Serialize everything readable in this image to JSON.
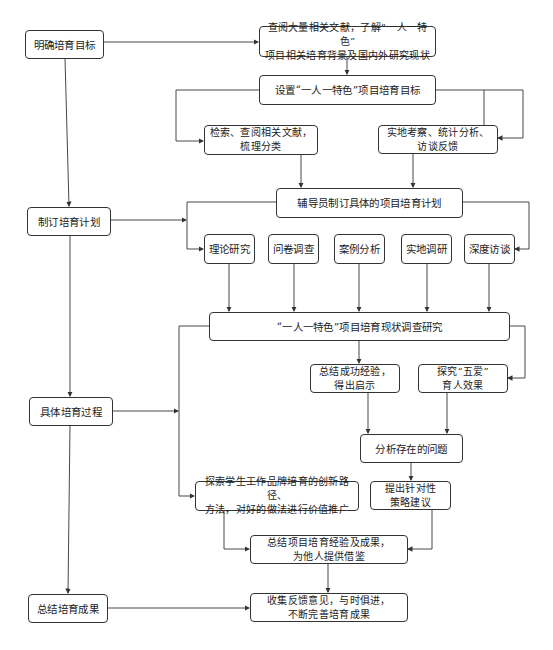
{
  "diagram": {
    "type": "flowchart",
    "stages": [
      {
        "id": "s1",
        "label": "明确培育目标"
      },
      {
        "id": "s2",
        "label": "制订培育计划"
      },
      {
        "id": "s3",
        "label": "具体培育过程"
      },
      {
        "id": "s4",
        "label": "总结培育成果"
      }
    ],
    "nodes": {
      "n_review": "查阅大量相关文献，了解“一人一特色”\n项目相关培育背景及国内外研究现状",
      "n_set_goal": "设置“一人一特色”项目培育目标",
      "n_search": "检索、查阅相关文献，\n梳理分类",
      "n_field": "实地考察、统计分析、\n访谈反馈",
      "n_plan": "辅导员制订具体的项目培育计划",
      "n_m1": "理论研究",
      "n_m2": "问卷调查",
      "n_m3": "案例分析",
      "n_m4": "实地调研",
      "n_m5": "深度访谈",
      "n_survey": "“一人一特色”项目培育现状调查研究",
      "n_experience": "总结成功经验，\n得出启示",
      "n_wuai": "探究“五爱”\n育人效果",
      "n_problem": "分析存在的问题",
      "n_explore": "探索学生工作品牌培育的创新路径、\n方法，对好的做法进行价值推广",
      "n_suggest": "提出针对性\n策略建议",
      "n_summary": "总结项目培育经验及成果，\n为他人提供借鉴",
      "n_feedback": "收集反馈意见，与时俱进，\n不断完善培育成果"
    },
    "edges": [
      [
        "s1",
        "s2"
      ],
      [
        "s2",
        "s3"
      ],
      [
        "s3",
        "s4"
      ],
      [
        "s1",
        "n_review"
      ],
      [
        "n_review",
        "n_set_goal"
      ],
      [
        "n_set_goal",
        "n_search"
      ],
      [
        "n_set_goal",
        "n_field"
      ],
      [
        "n_search",
        "n_plan"
      ],
      [
        "n_field",
        "n_plan"
      ],
      [
        "s2",
        "n_plan-branch"
      ],
      [
        "n_plan",
        "n_m1"
      ],
      [
        "n_plan",
        "n_m5"
      ],
      [
        "n_m1",
        "n_survey"
      ],
      [
        "n_m2",
        "n_survey"
      ],
      [
        "n_m3",
        "n_survey"
      ],
      [
        "n_m4",
        "n_survey"
      ],
      [
        "n_m5",
        "n_survey"
      ],
      [
        "s3",
        "n_survey-branch"
      ],
      [
        "n_survey",
        "n_experience"
      ],
      [
        "n_survey",
        "n_wuai"
      ],
      [
        "n_survey",
        "n_explore"
      ],
      [
        "n_experience",
        "n_problem"
      ],
      [
        "n_wuai",
        "n_problem"
      ],
      [
        "n_problem",
        "n_suggest"
      ],
      [
        "n_explore",
        "n_summary"
      ],
      [
        "n_suggest",
        "n_summary"
      ],
      [
        "n_summary",
        "n_feedback"
      ],
      [
        "s4",
        "n_feedback"
      ]
    ],
    "line_color": "#333333"
  }
}
